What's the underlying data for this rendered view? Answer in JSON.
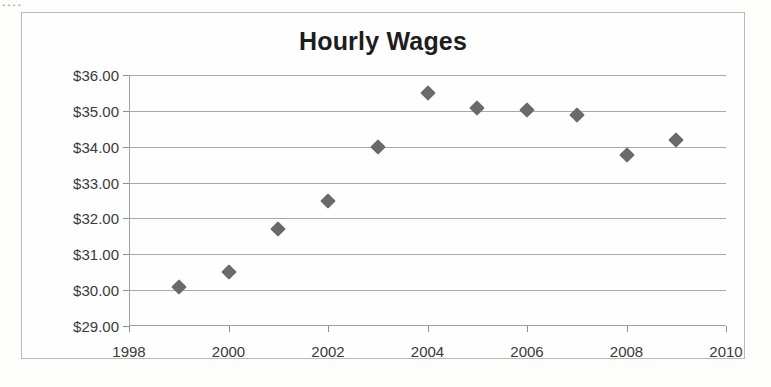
{
  "scan": {
    "artifact_text": "...."
  },
  "chart_data": {
    "type": "scatter",
    "title": "Hourly Wages",
    "xlabel": "",
    "ylabel": "",
    "x": [
      1999,
      2000,
      2001,
      2002,
      2003,
      2004,
      2005,
      2006,
      2007,
      2008,
      2009
    ],
    "values": [
      30.1,
      30.5,
      31.7,
      32.5,
      34.0,
      35.5,
      35.08,
      35.03,
      34.88,
      33.78,
      34.2
    ],
    "series": [
      {
        "name": "Hourly Wages",
        "points": [
          {
            "x": 1999,
            "y": 30.1
          },
          {
            "x": 2000,
            "y": 30.5
          },
          {
            "x": 2001,
            "y": 31.7
          },
          {
            "x": 2002,
            "y": 32.5
          },
          {
            "x": 2003,
            "y": 34.0
          },
          {
            "x": 2004,
            "y": 35.5
          },
          {
            "x": 2005,
            "y": 35.08
          },
          {
            "x": 2006,
            "y": 35.03
          },
          {
            "x": 2007,
            "y": 34.88
          },
          {
            "x": 2008,
            "y": 33.78
          },
          {
            "x": 2009,
            "y": 34.2
          }
        ]
      }
    ],
    "xlim": [
      1998,
      2010
    ],
    "ylim": [
      29,
      36
    ],
    "x_ticks": [
      1998,
      2000,
      2002,
      2004,
      2006,
      2008,
      2010
    ],
    "x_tick_labels": [
      "1998",
      "2000",
      "2002",
      "2004",
      "2006",
      "2008",
      "2010"
    ],
    "y_ticks": [
      29,
      30,
      31,
      32,
      33,
      34,
      35,
      36
    ],
    "y_tick_labels": [
      "$29.00",
      "$30.00",
      "$31.00",
      "$32.00",
      "$33.00",
      "$34.00",
      "$35.00",
      "$36.00"
    ],
    "grid": "horizontal",
    "legend": "none",
    "marker_shape": "diamond",
    "marker_color": "#6a6a6a",
    "gridline_color": "#a8a8a8",
    "text_color": "#3a3a3a",
    "title_color": "#1d1d1d",
    "border_color": "#b9b9b9",
    "background": "#fefefe"
  }
}
